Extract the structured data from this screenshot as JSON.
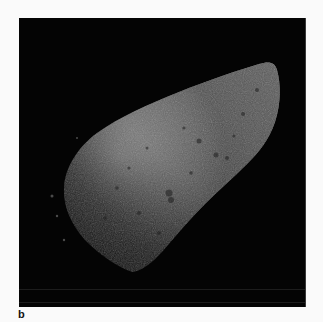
{
  "figure": {
    "panel_label": "b",
    "colors": {
      "background": "#fafafa",
      "space": "#040404",
      "surface_light": "#c8c8c8",
      "surface_dark": "#2a2a2a"
    }
  }
}
